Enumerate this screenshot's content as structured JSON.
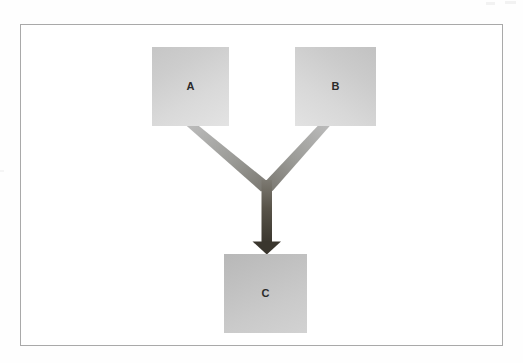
{
  "diagram": {
    "background_color": "#fefefe",
    "frame": {
      "border_color": "#a9a9a9",
      "fill_color": "#ffffff"
    },
    "nodes": [
      {
        "id": "a",
        "label": "A",
        "shape": "rectangle",
        "fill_from": "#c6c6c6",
        "fill_to": "#e3e3e3",
        "text_color": "#2b2b2b"
      },
      {
        "id": "b",
        "label": "B",
        "shape": "rectangle",
        "fill_from": "#c2c2c2",
        "fill_to": "#e2e2e2",
        "text_color": "#2b2b2b"
      },
      {
        "id": "c",
        "label": "C",
        "shape": "rectangle",
        "fill_from": "#b8b8b8",
        "fill_to": "#d2d2d2",
        "text_color": "#2b2b2b"
      }
    ],
    "connector": {
      "type": "merge-arrow",
      "from": [
        "A",
        "B"
      ],
      "to": "C",
      "stroke_light": "#b4b4b4",
      "stroke_dark": "#3a362e",
      "arrowhead_color": "#3a362e",
      "description": "Arrows from A and B merge into a single arrow pointing down into C"
    }
  }
}
